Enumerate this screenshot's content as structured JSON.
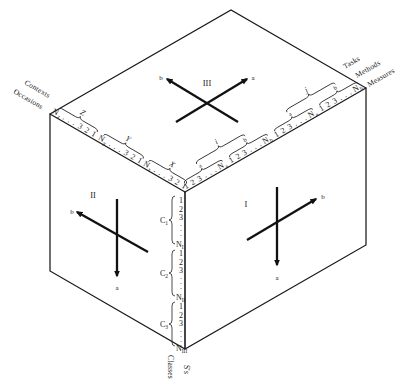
{
  "figure": {
    "faces": {
      "top": {
        "label": "III",
        "axis_a": "a",
        "axis_b": "b"
      },
      "right": {
        "label": "I",
        "axis_a": "a",
        "axis_b": "b"
      },
      "left": {
        "label": "II",
        "axis_a": "a",
        "axis_b": "b"
      }
    },
    "left_edge": {
      "axis_labels": [
        "Contexts",
        "Occasions"
      ],
      "groups": [
        {
          "brace": "Z",
          "node": "N",
          "node_sub": "z",
          "seq": ". . . 3 2 1"
        },
        {
          "brace": "Y",
          "node": "N",
          "node_sub": "y",
          "seq": ". . . 3 2 1"
        },
        {
          "brace": "X",
          "node": "N",
          "node_sub": "x",
          "seq": ". . . 3 2 1"
        }
      ]
    },
    "right_edge": {
      "axis_labels": [
        "Tasks",
        "Methods",
        "Measures"
      ],
      "groups": [
        {
          "brace": "a",
          "seq": "1 2 3 . . .",
          "node": "N",
          "node_sub": "a"
        },
        {
          "brace": "b",
          "seq": "1 2 3 . . .",
          "node": "N",
          "node_sub": "b"
        },
        {
          "brace": "a",
          "seq": "1 2 3 . . .",
          "node": "N",
          "node_sub": "a"
        },
        {
          "brace": "b",
          "seq": "1 2 3 . . .",
          "node": "N",
          "node_sub": "b"
        }
      ],
      "outer_braces": [
        {
          "label": "i"
        },
        {
          "label": "j"
        }
      ]
    },
    "front_edge": {
      "axis_labels": [
        "Classes",
        "S's"
      ],
      "groups": [
        {
          "brace": "C",
          "brace_sub": "1",
          "seq": [
            "1",
            "2",
            "3",
            ".",
            ".",
            "."
          ],
          "node": "N",
          "node_sub": "I"
        },
        {
          "brace": "C",
          "brace_sub": "2",
          "seq": [
            "1",
            "2",
            "3",
            ".",
            ".",
            "."
          ],
          "node": "N",
          "node_sub": "II"
        },
        {
          "brace": "C",
          "brace_sub": "3",
          "seq": [
            "1",
            "2",
            "3",
            ".",
            ".",
            "."
          ],
          "node": "N",
          "node_sub": "III"
        }
      ]
    }
  }
}
